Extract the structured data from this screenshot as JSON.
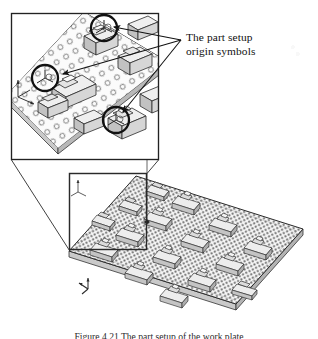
{
  "figure": {
    "type": "engineering-illustration",
    "caption": "Figure 4.21  The part setup of the work plate"
  },
  "callout": {
    "label_line1": "The part setup",
    "label_line2": "origin symbols",
    "label_full": "The part setup\norigin symbols",
    "leader_count": 3,
    "leader_apex": {
      "x": 181,
      "y": 40
    },
    "leader_targets": [
      {
        "x": 110,
        "y": 26,
        "name": "origin-symbol-top"
      },
      {
        "x": 63,
        "y": 73,
        "name": "origin-symbol-left"
      },
      {
        "x": 120,
        "y": 118,
        "name": "origin-symbol-bottom"
      }
    ]
  },
  "detail_view": {
    "name": "magnified-detail",
    "box": {
      "x": 11,
      "y": 13,
      "width": 148,
      "height": 147
    },
    "highlight_circles": [
      {
        "cx": 104,
        "cy": 28,
        "r": 13,
        "name": "origin-circle-1"
      },
      {
        "cx": 45,
        "cy": 78,
        "r": 13,
        "name": "origin-circle-2"
      },
      {
        "cx": 116,
        "cy": 120,
        "r": 13,
        "name": "origin-circle-3"
      }
    ],
    "axis_marker": {
      "x": 17,
      "y": 82,
      "name": "coordinate-axis-detail"
    },
    "part_count": 6,
    "hole_grid": {
      "rows": 11,
      "cols": 14
    }
  },
  "overview_view": {
    "name": "overview-plate",
    "selection_box": {
      "x": 69,
      "y": 173,
      "width": 78,
      "height": 77
    },
    "axis_marker": {
      "x": 84,
      "y": 281,
      "name": "coordinate-axis-overview"
    },
    "plate": {
      "corners": [
        {
          "x": 136,
          "y": 176
        },
        {
          "x": 303,
          "y": 229
        },
        {
          "x": 236,
          "y": 304
        },
        {
          "x": 69,
          "y": 251
        }
      ]
    },
    "part_count": 16,
    "connector_lines": [
      {
        "x1": 11,
        "x2": 69,
        "y1": 160,
        "y2": 251,
        "name": "callout-connector-left"
      },
      {
        "x1": 159,
        "x2": 147,
        "y1": 160,
        "y2": 173,
        "name": "callout-connector-right"
      }
    ]
  },
  "colors": {
    "ink": "#1a1a1a",
    "plate_fill": "#f2f2f2",
    "plate_shade": "#d9d9d9",
    "hole": "#9a9a9a",
    "frame": "#222222",
    "circle": "#111111"
  }
}
